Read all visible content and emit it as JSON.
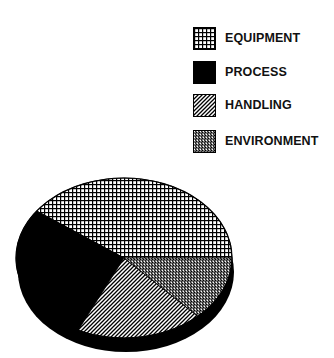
{
  "chart_data": {
    "type": "pie",
    "title": "",
    "style": "3d-pie-with-hatch-patterns",
    "start_angle_deg": 0,
    "direction": "counterclockwise",
    "categories": [
      "EQUIPMENT",
      "PROCESS",
      "HANDLING",
      "ENVIRONMENT"
    ],
    "values": [
      40,
      28,
      19,
      13
    ],
    "units": "percent (estimated from slice angles)",
    "series": [
      {
        "name": "EQUIPMENT",
        "value": 40,
        "pattern": "grid"
      },
      {
        "name": "PROCESS",
        "value": 28,
        "pattern": "solid-black"
      },
      {
        "name": "HANDLING",
        "value": 19,
        "pattern": "diagonal-hatch"
      },
      {
        "name": "ENVIRONMENT",
        "value": 13,
        "pattern": "dense-checker"
      }
    ],
    "legend_position": "top-right",
    "data_labels": false
  },
  "legend": {
    "items": [
      {
        "label": "EQUIPMENT",
        "pattern": "grid"
      },
      {
        "label": "PROCESS",
        "pattern": "solid-black"
      },
      {
        "label": "HANDLING",
        "pattern": "diagonal-hatch"
      },
      {
        "label": "ENVIRONMENT",
        "pattern": "dense-checker"
      }
    ]
  },
  "colors": {
    "ink": "#000000",
    "background": "#ffffff"
  }
}
